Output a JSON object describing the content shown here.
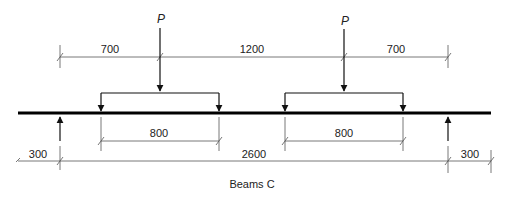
{
  "diagram": {
    "title": "Beams C",
    "load_label": "P",
    "loads": [
      {
        "label": "P"
      },
      {
        "label": "P"
      }
    ],
    "top_dimensions": [
      "700",
      "1200",
      "700"
    ],
    "spreader_dimensions": [
      "800",
      "800"
    ],
    "bottom_dimensions": [
      "300",
      "2600",
      "300"
    ],
    "colors": {
      "line": "#000000",
      "dimension": "#555555",
      "background": "#ffffff"
    }
  }
}
